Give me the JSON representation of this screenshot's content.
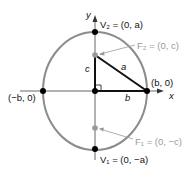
{
  "diagram": {
    "axes": {
      "x_label": "x",
      "y_label": "y"
    },
    "points": {
      "v2": {
        "label": "V₂ = (0, a)"
      },
      "v1": {
        "label": "V₁ = (0, −a)"
      },
      "f2": {
        "label": "F₂ = (0, c)"
      },
      "f1": {
        "label": "F₁ = (0, −c)"
      },
      "right": {
        "label": "(b, 0)"
      },
      "left": {
        "label": "(−b, 0)"
      }
    },
    "segments": {
      "c": "c",
      "a": "a",
      "b": "b"
    },
    "colors": {
      "ellipse": "#8c8c8c",
      "focus": "#9a9a9a",
      "axis": "#555555",
      "triangle": "#111111"
    }
  }
}
